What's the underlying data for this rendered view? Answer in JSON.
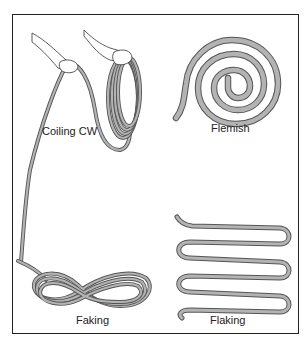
{
  "figure": {
    "panels": [
      {
        "id": "coiling",
        "label": "Coiling CW"
      },
      {
        "id": "flemish",
        "label": "Flemish"
      },
      {
        "id": "faking",
        "label": "Faking"
      },
      {
        "id": "flaking",
        "label": "Flaking"
      }
    ],
    "colors": {
      "rope_fill": "#b3b3b3",
      "rope_outline": "#555555",
      "frame": "#222222",
      "background": "#ffffff"
    }
  }
}
